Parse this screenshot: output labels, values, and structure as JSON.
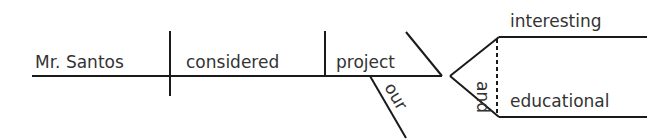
{
  "diagram": {
    "type": "sentence-diagram",
    "sentence_parts": {
      "subject": "Mr. Santos",
      "verb": "considered",
      "direct_object": "project",
      "object_modifier": "our",
      "object_complement_1": "interesting",
      "conjunction": "and",
      "object_complement_2": "educational"
    },
    "colors": {
      "line": "#1a1a1a",
      "text": "#333333",
      "background": "#ffffff"
    }
  }
}
